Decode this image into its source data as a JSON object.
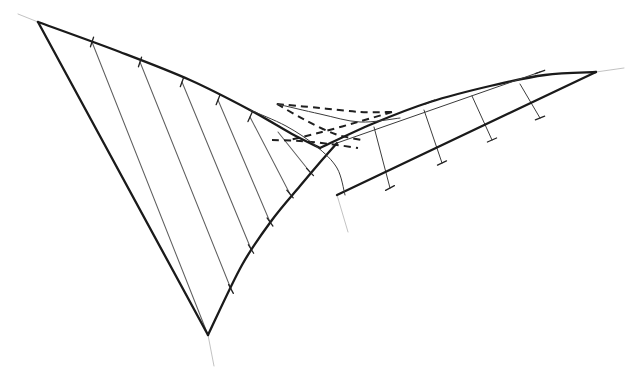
{
  "figure": {
    "subtitle": "Ruled surface with cuspidal edges and self-intersection curve",
    "background_color": "#ffffff",
    "ink_color": "#1a1a1a",
    "ruling_color": "#5f5f5f",
    "hidden_color": "#1f1f1f",
    "extension_color": "#aeaeae",
    "style": "hand-drawn pen line drawing, no labels, no axes, no text"
  },
  "chart_data": {
    "type": "line",
    "xlabel": "",
    "ylabel": "",
    "xlim": [
      0,
      636
    ],
    "ylim": [
      0,
      376
    ],
    "grid": false,
    "legend": "none",
    "vertices": [
      {
        "name": "upper-left-corner",
        "x": 38,
        "y": 22
      },
      {
        "name": "bottom-cusp",
        "x": 208,
        "y": 335
      },
      {
        "name": "right-tip",
        "x": 596,
        "y": 72
      },
      {
        "name": "upper-right-corner",
        "x": 540,
        "y": 72
      },
      {
        "name": "center-node",
        "x": 320,
        "y": 148
      },
      {
        "name": "lower-center-node",
        "x": 337,
        "y": 195
      },
      {
        "name": "swallowtail-left",
        "x": 277,
        "y": 104
      },
      {
        "name": "swallowtail-right",
        "x": 372,
        "y": 124
      }
    ],
    "series": [
      {
        "name": "upper-left-cuspidal-edge",
        "kind": "curve",
        "style": "solid-heavy",
        "points": [
          [
            38,
            22
          ],
          [
            120,
            52
          ],
          [
            190,
            80
          ],
          [
            250,
            110
          ],
          [
            292,
            134
          ],
          [
            320,
            148
          ]
        ]
      },
      {
        "name": "left-outer-straight-edge",
        "kind": "line",
        "style": "solid-heavy",
        "points": [
          [
            38,
            22
          ],
          [
            208,
            335
          ]
        ]
      },
      {
        "name": "lower-left-cuspidal-edge",
        "kind": "curve",
        "style": "solid-heavy",
        "points": [
          [
            208,
            335
          ],
          [
            242,
            265
          ],
          [
            272,
            220
          ],
          [
            300,
            186
          ],
          [
            322,
            160
          ],
          [
            337,
            143
          ]
        ]
      },
      {
        "name": "upper-right-cuspidal-edge",
        "kind": "curve",
        "style": "solid-heavy",
        "points": [
          [
            320,
            148
          ],
          [
            372,
            124
          ],
          [
            430,
            102
          ],
          [
            490,
            86
          ],
          [
            545,
            75
          ],
          [
            596,
            72
          ]
        ]
      },
      {
        "name": "right-lower-straight-edge",
        "kind": "line",
        "style": "solid-heavy",
        "points": [
          [
            337,
            195
          ],
          [
            596,
            72
          ]
        ]
      },
      {
        "name": "right-upper-inner-edge",
        "kind": "line",
        "style": "solid-light",
        "points": [
          [
            337,
            143
          ],
          [
            540,
            72
          ]
        ]
      },
      {
        "name": "left-inner-fold-edge",
        "kind": "curve",
        "style": "solid-light",
        "points": [
          [
            250,
            110
          ],
          [
            286,
            126
          ],
          [
            316,
            146
          ],
          [
            337,
            168
          ],
          [
            345,
            195
          ]
        ]
      },
      {
        "name": "self-intersection-upper",
        "kind": "curve",
        "style": "solid-light",
        "points": [
          [
            277,
            104
          ],
          [
            320,
            114
          ],
          [
            360,
            122
          ],
          [
            400,
            118
          ]
        ]
      }
    ],
    "hidden_curves": [
      {
        "name": "hidden-edge-upper",
        "points": [
          [
            277,
            104
          ],
          [
            320,
            108
          ],
          [
            360,
            112
          ],
          [
            392,
            112
          ]
        ],
        "dash": "7 5"
      },
      {
        "name": "hidden-edge-diagonal-a",
        "points": [
          [
            277,
            104
          ],
          [
            305,
            120
          ],
          [
            335,
            134
          ],
          [
            362,
            140
          ]
        ],
        "dash": "7 5"
      },
      {
        "name": "hidden-edge-diagonal-b",
        "points": [
          [
            392,
            112
          ],
          [
            358,
            122
          ],
          [
            322,
            132
          ],
          [
            290,
            140
          ]
        ],
        "dash": "7 5"
      },
      {
        "name": "hidden-edge-lower",
        "points": [
          [
            272,
            140
          ],
          [
            300,
            141
          ],
          [
            330,
            144
          ],
          [
            358,
            148
          ]
        ],
        "dash": "7 5"
      }
    ],
    "rulings_left": [
      {
        "t": 0.16,
        "from": [
          92,
          42
        ],
        "to": [
          208,
          335
        ]
      },
      {
        "t": 0.32,
        "from": [
          140,
          62
        ],
        "to": [
          231,
          289
        ]
      },
      {
        "t": 0.48,
        "from": [
          182,
          82
        ],
        "to": [
          251,
          249
        ]
      },
      {
        "t": 0.64,
        "from": [
          218,
          100
        ],
        "to": [
          270,
          222
        ]
      },
      {
        "t": 0.8,
        "from": [
          250,
          117
        ],
        "to": [
          290,
          194
        ]
      },
      {
        "t": 0.92,
        "from": [
          278,
          132
        ],
        "to": [
          310,
          172
        ]
      }
    ],
    "rulings_right": [
      {
        "t": 0.2,
        "from": [
          374,
          127
        ],
        "to": [
          390,
          188
        ]
      },
      {
        "t": 0.4,
        "from": [
          424,
          110
        ],
        "to": [
          442,
          163
        ]
      },
      {
        "t": 0.6,
        "from": [
          472,
          96
        ],
        "to": [
          492,
          140
        ]
      },
      {
        "t": 0.8,
        "from": [
          520,
          84
        ],
        "to": [
          540,
          118
        ]
      }
    ],
    "tickmarks": [
      {
        "x": 92,
        "y": 42,
        "angle": 72
      },
      {
        "x": 140,
        "y": 62,
        "angle": 72
      },
      {
        "x": 182,
        "y": 82,
        "angle": 70
      },
      {
        "x": 218,
        "y": 100,
        "angle": 68
      },
      {
        "x": 250,
        "y": 117,
        "angle": 66
      },
      {
        "x": 231,
        "y": 289,
        "angle": 118
      },
      {
        "x": 251,
        "y": 249,
        "angle": 122
      },
      {
        "x": 270,
        "y": 222,
        "angle": 126
      },
      {
        "x": 290,
        "y": 194,
        "angle": 130
      },
      {
        "x": 310,
        "y": 172,
        "angle": 134
      },
      {
        "x": 390,
        "y": 188,
        "angle": 28
      },
      {
        "x": 442,
        "y": 163,
        "angle": 26
      },
      {
        "x": 492,
        "y": 140,
        "angle": 24
      },
      {
        "x": 540,
        "y": 118,
        "angle": 22
      },
      {
        "x": 540,
        "y": 72,
        "angle": 20
      },
      {
        "x": 430,
        "y": 102,
        "angle": 22
      }
    ],
    "extensions": [
      {
        "name": "ext-upper-left",
        "from": [
          38,
          22
        ],
        "to": [
          18,
          14
        ]
      },
      {
        "name": "ext-bottom-cusp",
        "from": [
          208,
          335
        ],
        "to": [
          214,
          366
        ]
      },
      {
        "name": "ext-right-tip",
        "from": [
          596,
          72
        ],
        "to": [
          624,
          68
        ]
      },
      {
        "name": "ext-lower-center",
        "from": [
          337,
          195
        ],
        "to": [
          348,
          232
        ]
      }
    ]
  }
}
